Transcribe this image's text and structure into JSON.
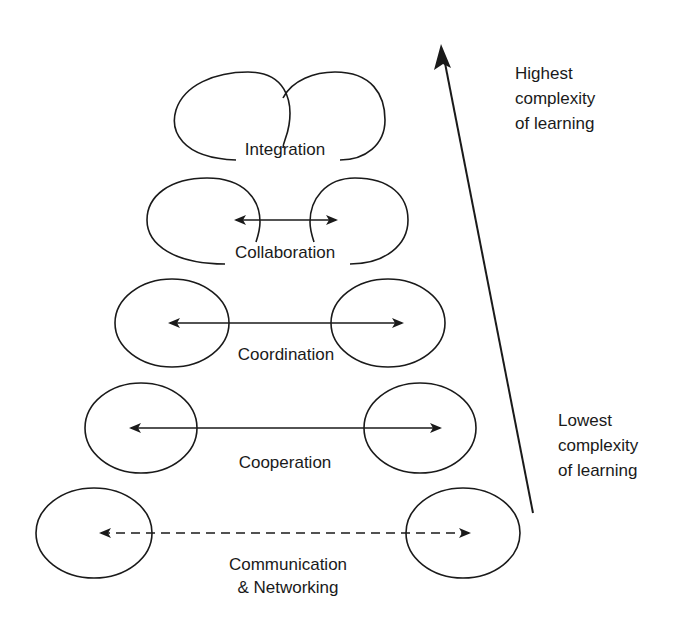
{
  "diagram": {
    "type": "hierarchy-of-collaboration",
    "levels": [
      {
        "label": "Integration",
        "connector": "merged-circles"
      },
      {
        "label": "Collaboration",
        "connector": "solid-double-arrow"
      },
      {
        "label": "Coordination",
        "connector": "solid-double-arrow"
      },
      {
        "label": "Cooperation",
        "connector": "solid-double-arrow"
      },
      {
        "label": "Communication",
        "label2": "& Networking",
        "connector": "dashed-double-arrow"
      }
    ],
    "axis": {
      "top_label": [
        "Highest",
        "complexity",
        "of learning"
      ],
      "bottom_label": [
        "Lowest",
        "complexity",
        "of learning"
      ],
      "direction": "up"
    },
    "colors": {
      "stroke": "#1a1a1a",
      "background": "#ffffff"
    }
  }
}
